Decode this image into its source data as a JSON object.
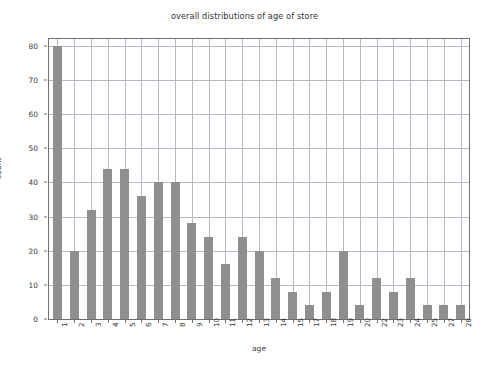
{
  "chart_data": {
    "type": "bar",
    "title": "overall distributions of age of store",
    "xlabel": "age",
    "ylabel": "count",
    "categories": [
      "1",
      "2",
      "3",
      "4",
      "5",
      "6",
      "7",
      "8",
      "9",
      "10",
      "11",
      "12",
      "13",
      "14",
      "15",
      "17",
      "18",
      "19",
      "20",
      "22",
      "23",
      "24",
      "25",
      "27",
      "28"
    ],
    "values": [
      80,
      20,
      32,
      44,
      44,
      36,
      40,
      40,
      28,
      24,
      16,
      24,
      20,
      12,
      8,
      4,
      8,
      20,
      4,
      12,
      8,
      12,
      4,
      4,
      4
    ],
    "ylim": [
      0,
      82
    ],
    "yticks": [
      0,
      10,
      20,
      30,
      40,
      50,
      60,
      70,
      80
    ],
    "ytick_labels": [
      "0",
      "10",
      "20",
      "30",
      "40",
      "50",
      "60",
      "70",
      "80"
    ],
    "grid": true,
    "legend": null,
    "bar_color": "#8f8f8f",
    "grid_color": "#b8b8c4",
    "axes_color": "#6f6f6f",
    "background_color": "#ffffff"
  }
}
